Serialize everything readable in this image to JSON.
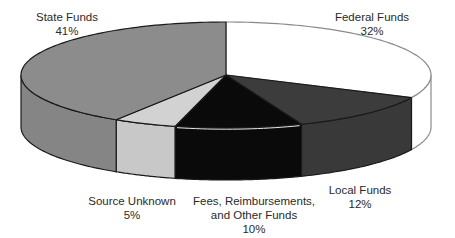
{
  "chart_data": {
    "type": "pie",
    "style": "3d",
    "title": "",
    "start_angle": "top (12 o'clock), clockwise",
    "slices": [
      {
        "label": "Federal Funds",
        "value": 32,
        "display": "32%",
        "color": "#ffffff"
      },
      {
        "label": "Local Funds",
        "value": 12,
        "display": "12%",
        "color": "#3c3c3c"
      },
      {
        "label": "Fees, Reimbursements, and Other Funds",
        "display": "10%",
        "value": 10,
        "color": "#0a0a0a"
      },
      {
        "label": "Source Unknown",
        "value": 5,
        "display": "5%",
        "color": "#d2d2d2"
      },
      {
        "label": "State Funds",
        "value": 41,
        "display": "41%",
        "color": "#8c8c8c"
      }
    ],
    "legend": "none (direct labels)"
  },
  "labels": {
    "state": {
      "line1": "State Funds",
      "line2": "41%"
    },
    "federal": {
      "line1": "Federal Funds",
      "line2": "32%"
    },
    "local": {
      "line1": "Local Funds",
      "line2": "12%"
    },
    "fees": {
      "line1": "Fees, Reimbursements,",
      "line2": "and Other Funds",
      "line3": "10%"
    },
    "unknown": {
      "line1": "Source Unknown",
      "line2": "5%"
    }
  }
}
